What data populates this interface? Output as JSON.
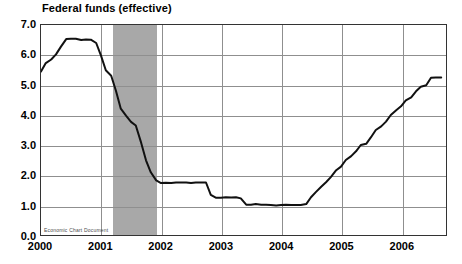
{
  "chart_data": {
    "type": "line",
    "title": "Federal funds (effective)",
    "xlabel": "",
    "ylabel": "",
    "ylim": [
      0.0,
      7.0
    ],
    "xlim": [
      2000.0,
      2006.75
    ],
    "grid": true,
    "legend": false,
    "ytick_labels": [
      "7.0",
      "6.0",
      "5.0",
      "4.0",
      "3.0",
      "2.0",
      "1.0",
      "0.0"
    ],
    "ytick_values": [
      7.0,
      6.0,
      5.0,
      4.0,
      3.0,
      2.0,
      1.0,
      0.0
    ],
    "xtick_labels": [
      "2000",
      "2001",
      "2002",
      "2003",
      "2004",
      "2005",
      "2006"
    ],
    "xtick_values": [
      2000,
      2001,
      2002,
      2003,
      2004,
      2005,
      2006
    ],
    "shaded_regions": [
      {
        "label": "recession",
        "start": 2001.2,
        "end": 2001.92,
        "color": "#a8a8a8"
      }
    ],
    "series": [
      {
        "name": "Federal funds (effective)",
        "color": "#111111",
        "x": [
          2000.0,
          2000.08,
          2000.17,
          2000.25,
          2000.33,
          2000.42,
          2000.5,
          2000.58,
          2000.67,
          2000.75,
          2000.83,
          2000.92,
          2001.0,
          2001.08,
          2001.17,
          2001.25,
          2001.33,
          2001.42,
          2001.5,
          2001.58,
          2001.67,
          2001.75,
          2001.83,
          2001.92,
          2002.0,
          2002.08,
          2002.17,
          2002.25,
          2002.33,
          2002.42,
          2002.5,
          2002.58,
          2002.67,
          2002.75,
          2002.83,
          2002.92,
          2003.0,
          2003.08,
          2003.17,
          2003.25,
          2003.33,
          2003.42,
          2003.5,
          2003.58,
          2003.67,
          2003.75,
          2003.83,
          2003.92,
          2004.0,
          2004.08,
          2004.17,
          2004.25,
          2004.33,
          2004.42,
          2004.5,
          2004.58,
          2004.67,
          2004.75,
          2004.83,
          2004.92,
          2005.0,
          2005.08,
          2005.17,
          2005.25,
          2005.33,
          2005.42,
          2005.5,
          2005.58,
          2005.67,
          2005.75,
          2005.83,
          2005.92,
          2006.0,
          2006.08,
          2006.17,
          2006.25,
          2006.33,
          2006.42,
          2006.5,
          2006.58,
          2006.67
        ],
        "y": [
          5.45,
          5.73,
          5.85,
          6.02,
          6.27,
          6.53,
          6.54,
          6.54,
          6.5,
          6.52,
          6.51,
          6.4,
          5.98,
          5.49,
          5.31,
          4.8,
          4.21,
          3.97,
          3.77,
          3.65,
          3.07,
          2.49,
          2.09,
          1.82,
          1.73,
          1.74,
          1.73,
          1.75,
          1.75,
          1.75,
          1.73,
          1.75,
          1.75,
          1.75,
          1.34,
          1.24,
          1.24,
          1.26,
          1.25,
          1.26,
          1.22,
          1.01,
          1.01,
          1.03,
          1.01,
          1.01,
          1.0,
          0.98,
          1.0,
          1.01,
          1.0,
          1.0,
          1.0,
          1.03,
          1.26,
          1.43,
          1.61,
          1.76,
          1.93,
          2.16,
          2.28,
          2.5,
          2.63,
          2.79,
          3.0,
          3.04,
          3.26,
          3.5,
          3.62,
          3.78,
          4.0,
          4.16,
          4.29,
          4.49,
          4.59,
          4.79,
          4.94,
          4.99,
          5.24,
          5.25,
          5.25
        ]
      }
    ]
  },
  "watermark": {
    "text": "Economic Chart Document"
  }
}
